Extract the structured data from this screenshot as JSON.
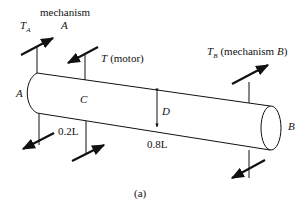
{
  "figure": {
    "caption": "(a)",
    "labels": {
      "mechanism_a_word": "mechanism",
      "mechanism_a_letter": "A",
      "torque_a_main": "T",
      "torque_a_sub": "A",
      "torque_motor_main": "T",
      "torque_motor_suffix": "(motor)",
      "torque_b_main": "T",
      "torque_b_sub": "B",
      "torque_b_suffix_open": "(mechanism ",
      "torque_b_suffix_letter": "B",
      "torque_b_suffix_close": ")",
      "end_a": "A",
      "end_b": "B",
      "point_c": "C",
      "diameter": "D",
      "length_ac": "0.2L",
      "length_cb": "0.8L"
    },
    "colors": {
      "ink": "#111111",
      "background": "#ffffff"
    }
  }
}
